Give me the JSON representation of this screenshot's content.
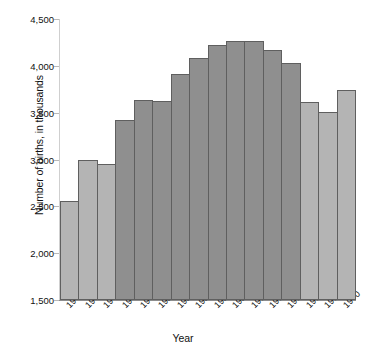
{
  "chart_data": {
    "type": "bar",
    "title": "",
    "xlabel": "Year",
    "ylabel": "Number of births, in thousands",
    "ylim": [
      1500,
      4500
    ],
    "ytick_values": [
      4500,
      4000,
      3500,
      3000,
      2500,
      2000,
      1500
    ],
    "ytick_labels": [
      "4,500",
      "4,000",
      "3,500",
      "3,000",
      "2,500",
      "2,000",
      "1,500"
    ],
    "grid": false,
    "legend": "none",
    "categories": [
      "1940",
      "1942",
      "1944",
      "1946",
      "1948",
      "1950",
      "1952",
      "1954",
      "1956",
      "1958",
      "1960",
      "1962",
      "1964",
      "1966",
      "1968",
      "1970"
    ],
    "values": [
      2560,
      2990,
      2950,
      3420,
      3640,
      3630,
      3910,
      4080,
      4220,
      4260,
      4260,
      4170,
      4030,
      3610,
      3510,
      3740
    ],
    "bar_colors": [
      "light",
      "light",
      "light",
      "dark",
      "dark",
      "dark",
      "dark",
      "dark",
      "dark",
      "dark",
      "dark",
      "dark",
      "dark",
      "light",
      "light",
      "light"
    ],
    "series": [
      {
        "name": "Number of births",
        "values": [
          2560,
          2990,
          2950,
          3420,
          3640,
          3630,
          3910,
          4080,
          4220,
          4260,
          4260,
          4170,
          4030,
          3610,
          3510,
          3740
        ]
      }
    ]
  },
  "colors": {
    "bar_light": "#b4b4b4",
    "bar_dark": "#8f8f8f",
    "bar_border": "#5f5f5f",
    "axis": "#8d8d8d",
    "text": "#111111",
    "background": "#ffffff"
  }
}
